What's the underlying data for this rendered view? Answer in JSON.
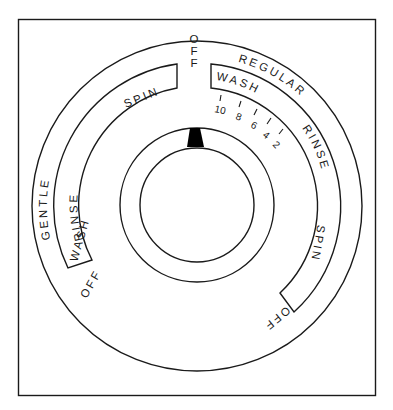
{
  "diagram": {
    "frame": {
      "stroke": "#1a1a1a",
      "background": "#ffffff"
    },
    "outer_ring": {
      "left_label": "GENTLE",
      "right_label": "REGULAR"
    },
    "top_off_label": "OFF",
    "gentle_band": {
      "segments": [
        "SPIN",
        "RINSE",
        "WASH"
      ],
      "end_label": "OFF"
    },
    "regular_band": {
      "segments": [
        "WASH",
        "RINSE",
        "SPIN"
      ],
      "end_label": "OFF",
      "wash_minutes": [
        "10",
        "8",
        "6",
        "4",
        "2"
      ]
    },
    "knob": {
      "pointer_color": "#000000",
      "pointer_position": "top"
    }
  }
}
